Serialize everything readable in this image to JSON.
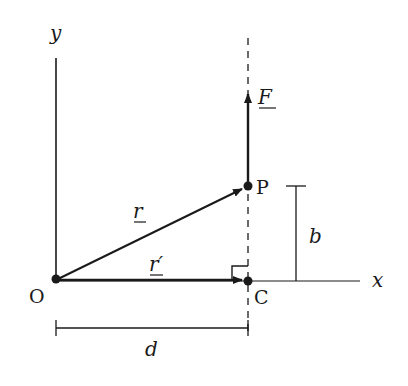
{
  "diagram": {
    "colors": {
      "ink": "#1a1a1a",
      "background": "#ffffff"
    },
    "axes": {
      "x_label": "x",
      "y_label": "y"
    },
    "points": {
      "origin": "O",
      "p": "P",
      "c": "C"
    },
    "vectors": {
      "force": "F",
      "r": "r",
      "r_prime": "r′"
    },
    "dimensions": {
      "b": "b",
      "d": "d"
    }
  }
}
